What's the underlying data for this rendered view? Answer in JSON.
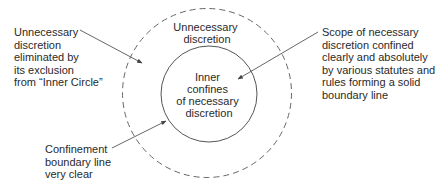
{
  "diagram": {
    "regions": {
      "outer": {
        "lines": [
          "Unnecessary",
          "discretion"
        ],
        "boundary_style": "dashed"
      },
      "inner": {
        "lines": [
          "Inner",
          "confines",
          "of necessary",
          "discretion"
        ],
        "boundary_style": "solid"
      }
    },
    "callouts": [
      {
        "id": "eliminated",
        "lines": [
          "Unnecessary",
          "discretion",
          "eliminated by",
          "its exclusion",
          "from “Inner Circle”"
        ],
        "points_to": "outer-region"
      },
      {
        "id": "scope",
        "lines": [
          "Scope of necessary",
          "discretion confined",
          "clearly and absolutely",
          "by various statutes and",
          "rules forming a solid",
          "boundary line"
        ],
        "points_to": "inner-region"
      },
      {
        "id": "confinement",
        "lines": [
          "Confinement",
          "boundary line",
          "very clear"
        ],
        "points_to": "inner-boundary"
      }
    ],
    "colors": {
      "line": "#555555",
      "text": "#2a2a2a",
      "background": "#ffffff"
    }
  }
}
